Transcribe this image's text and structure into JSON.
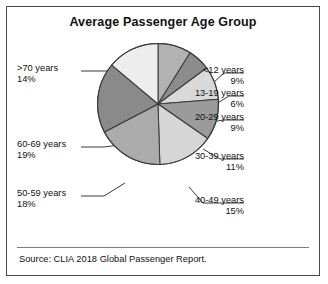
{
  "figure": {
    "title": "Average Passenger Age Group",
    "source": "Source: CLIA 2018 Global Passenger Report."
  },
  "chart_data": {
    "type": "pie",
    "title": "Average Passenger Age Group",
    "xlabel": "",
    "ylabel": "",
    "legend_position": "callout-labels",
    "grid": false,
    "start_angle_deg": 0,
    "direction": "clockwise",
    "unit": "%",
    "categories": [
      "<12 years",
      "13-19 years",
      "20-29 years",
      "30-39 years",
      "40-49 years",
      "50-59 years",
      "60-69 years",
      ">70 years"
    ],
    "values": [
      9,
      6,
      9,
      11,
      15,
      18,
      19,
      14
    ],
    "slice_colors": [
      "#b2b2b2",
      "#8c8c8c",
      "#d9d9d9",
      "#9b9b9b",
      "#d6d6d6",
      "#ababab",
      "#8a8a8a",
      "#ededed"
    ],
    "slices": [
      {
        "label": "<12 years",
        "value": 9,
        "display": "9%",
        "color": "#b2b2b2",
        "side": "right"
      },
      {
        "label": "13-19 years",
        "value": 6,
        "display": "6%",
        "color": "#8c8c8c",
        "side": "right"
      },
      {
        "label": "20-29 years",
        "value": 9,
        "display": "9%",
        "color": "#d9d9d9",
        "side": "right"
      },
      {
        "label": "30-39 years",
        "value": 11,
        "display": "11%",
        "color": "#9b9b9b",
        "side": "right"
      },
      {
        "label": "40-49 years",
        "value": 15,
        "display": "15%",
        "color": "#d6d6d6",
        "side": "right"
      },
      {
        "label": "50-59 years",
        "value": 18,
        "display": "18%",
        "color": "#ababab",
        "side": "left"
      },
      {
        "label": "60-69 years",
        "value": 19,
        "display": "19%",
        "color": "#8a8a8a",
        "side": "left"
      },
      {
        "label": ">70 years",
        "value": 14,
        "display": "14%",
        "color": "#ededed",
        "side": "left"
      }
    ],
    "stroke_color": "#3a3a3a"
  },
  "callouts": {
    "lt12": {
      "cat": "<12 years",
      "pct": "9%"
    },
    "a13_19": {
      "cat": "13-19 years",
      "pct": "6%"
    },
    "a20_29": {
      "cat": "20-29 years",
      "pct": "9%"
    },
    "a30_39": {
      "cat": "30-39 years",
      "pct": "11%"
    },
    "a40_49": {
      "cat": "40-49 years",
      "pct": "15%"
    },
    "a50_59": {
      "cat": "50-59 years",
      "pct": "18%"
    },
    "a60_69": {
      "cat": "60-69 years",
      "pct": "19%"
    },
    "gt70": {
      "cat": ">70 years",
      "pct": "14%"
    }
  }
}
